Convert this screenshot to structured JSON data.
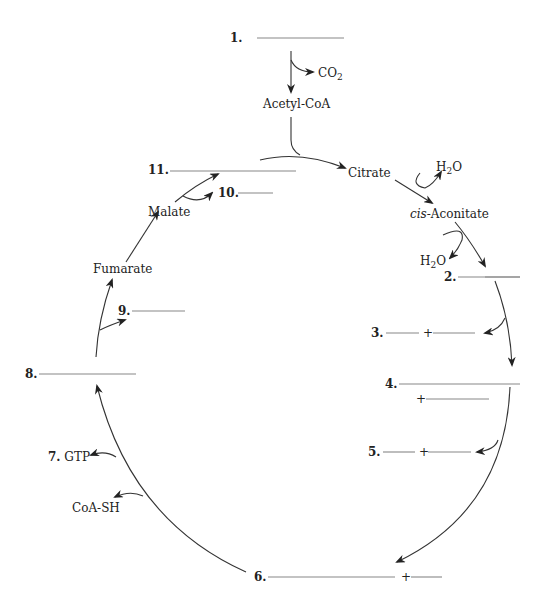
{
  "labels": {
    "n1": "1.",
    "n2": "2.",
    "n3": "3.",
    "n4": "4.",
    "n5": "5.",
    "n6": "6.",
    "n7": "7.",
    "n8": "8.",
    "n9": "9.",
    "n10": "10.",
    "n11": "11.",
    "plus": "+",
    "co2": "CO",
    "co2_sub": "2",
    "acetyl_coa": "Acetyl-CoA",
    "citrate": "Citrate",
    "h2o_a": "H",
    "h2o_a_sub": "2",
    "h2o_a_o": "O",
    "cis": "cis",
    "aconitate": "-Aconitate",
    "h2o_b": "H",
    "h2o_b_sub": "2",
    "h2o_b_o": "O",
    "gtp": "GTP",
    "coash": "CoA-SH",
    "fumarate": "Fumarate",
    "malate": "Malate"
  },
  "colors": {
    "line": "#888888",
    "arrow": "#222222",
    "text": "#222222"
  }
}
